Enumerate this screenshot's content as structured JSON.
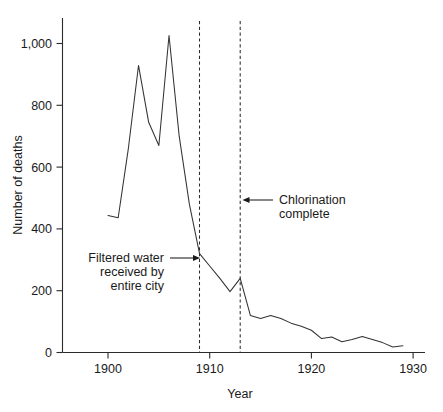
{
  "chart_data": {
    "type": "line",
    "title": "",
    "xlabel": "Year",
    "ylabel": "Number of deaths",
    "xlim": [
      1899,
      1930
    ],
    "ylim": [
      0,
      1080
    ],
    "grid": false,
    "legend": "none",
    "x_ticks": [
      1900,
      1910,
      1920,
      1930
    ],
    "x_tick_labels": [
      "1900",
      "1910",
      "1920",
      "1930"
    ],
    "y_ticks": [
      0,
      200,
      400,
      600,
      800,
      1000
    ],
    "y_tick_labels": [
      "0",
      "200",
      "400",
      "600",
      "800",
      "1,000"
    ],
    "series": [
      {
        "name": "Number of deaths",
        "x": [
          1900,
          1901,
          1902,
          1903,
          1904,
          1905,
          1906,
          1907,
          1908,
          1909,
          1910,
          1911,
          1912,
          1913,
          1914,
          1915,
          1916,
          1917,
          1918,
          1919,
          1920,
          1921,
          1922,
          1923,
          1924,
          1925,
          1926,
          1927,
          1928,
          1929
        ],
        "values": [
          443,
          436,
          660,
          929,
          745,
          670,
          1026,
          700,
          480,
          320,
          280,
          240,
          197,
          240,
          120,
          110,
          120,
          110,
          95,
          85,
          72,
          45,
          50,
          35,
          42,
          52,
          42,
          32,
          18,
          22
        ]
      }
    ],
    "annotations": [
      {
        "id": "filtered-water",
        "text_lines": [
          "Filtered water",
          "received by",
          "entire city"
        ],
        "points_to_year": 1909,
        "points_to_value": 320
      },
      {
        "id": "chlorination-complete",
        "text_lines": [
          "Chlorination",
          "complete"
        ],
        "points_to_year": 1913,
        "points_to_value": 495
      }
    ],
    "event_lines": [
      {
        "id": "filtered-water-line",
        "year": 1909,
        "style": "dashed"
      },
      {
        "id": "chlorination-line",
        "year": 1913,
        "style": "dashed"
      }
    ],
    "colors": {
      "series": "#333333",
      "axis": "#2b2b2b",
      "text": "#1a1a1a",
      "background": "#ffffff"
    }
  }
}
